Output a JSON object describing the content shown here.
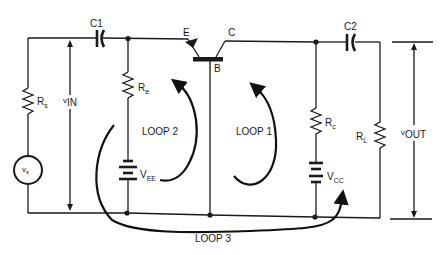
{
  "diagram": {
    "colors": {
      "ink": "#1a1a1a",
      "background": "#ffffff"
    },
    "components": {
      "c1": {
        "label": "C1"
      },
      "c2": {
        "label": "C2"
      },
      "rs": {
        "label": "R",
        "sub": "s"
      },
      "re": {
        "label": "R",
        "sub": "e"
      },
      "rc": {
        "label": "R",
        "sub": "c"
      },
      "rl": {
        "label": "R",
        "sub": "L"
      },
      "vs": {
        "label": "v",
        "sub": "s"
      },
      "vee": {
        "label": "V",
        "sub": "EE"
      },
      "vcc": {
        "label": "V",
        "sub": "CC"
      },
      "transistor": {
        "emitter": "E",
        "collector": "C",
        "base": "B"
      }
    },
    "voltages": {
      "vin": {
        "prefix": "v",
        "label": "IN"
      },
      "vout": {
        "prefix": "v",
        "label": "OUT"
      }
    },
    "loops": {
      "loop1": "LOOP 1",
      "loop2": "LOOP 2",
      "loop3": "LOOP 3"
    }
  }
}
